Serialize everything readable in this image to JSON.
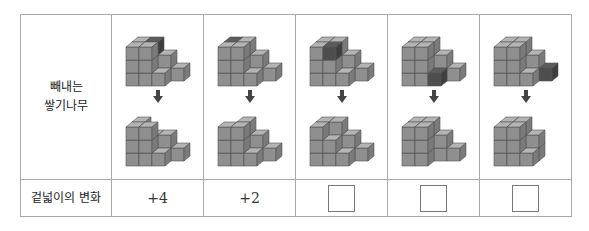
{
  "table": {
    "row1_header": [
      "빼내는",
      "쌓기나무"
    ],
    "row2_header": "겉넓이의 변화",
    "columns": [
      {
        "removed_position": "top-back-inner",
        "surface_change": "+4",
        "answer_blank": false
      },
      {
        "removed_position": "top-back-recess",
        "surface_change": "+2",
        "answer_blank": false
      },
      {
        "removed_position": "top-front-middle",
        "surface_change": "",
        "answer_blank": true
      },
      {
        "removed_position": "bottom-front-step",
        "surface_change": "",
        "answer_blank": true
      },
      {
        "removed_position": "right-step-end",
        "surface_change": "",
        "answer_blank": true
      }
    ]
  },
  "colors": {
    "cube_front": "#8f8f8f",
    "cube_top": "#b4b4b4",
    "cube_side": "#7a7a7a",
    "highlight": "#4e4e4e",
    "arrow": "#444444",
    "border": "#a8a8a8"
  }
}
